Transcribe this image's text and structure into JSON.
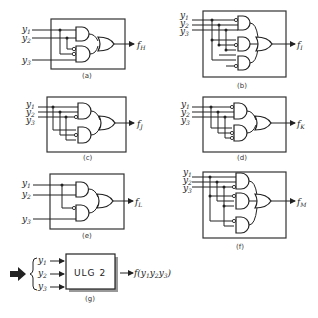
{
  "figure": {
    "panels": [
      {
        "id": "a",
        "caption": "(a)",
        "output": "f",
        "output_sub": "H",
        "inputs": [
          "y1",
          "y2",
          "y3"
        ]
      },
      {
        "id": "b",
        "caption": "(b)",
        "output": "f",
        "output_sub": "I",
        "inputs": [
          "y1",
          "y2",
          "y3"
        ]
      },
      {
        "id": "c",
        "caption": "(c)",
        "output": "f",
        "output_sub": "J",
        "inputs": [
          "y1",
          "y2",
          "y3"
        ]
      },
      {
        "id": "d",
        "caption": "(d)",
        "output": "f",
        "output_sub": "K",
        "inputs": [
          "y1",
          "y2",
          "y3"
        ]
      },
      {
        "id": "e",
        "caption": "(e)",
        "output": "f",
        "output_sub": "L",
        "inputs": [
          "y1",
          "y2",
          "y3"
        ]
      },
      {
        "id": "f",
        "caption": "(f)",
        "output": "f",
        "output_sub": "M",
        "inputs": [
          "y1",
          "y2",
          "y3"
        ]
      }
    ],
    "block": {
      "caption": "(g)",
      "label": "ULG 2",
      "inputs": [
        "y1",
        "y2",
        "y3"
      ],
      "output": "f(y1y2y3)"
    },
    "labels": {
      "y": "y",
      "s1": "1",
      "s2": "2",
      "s3": "3",
      "f": "f"
    }
  }
}
